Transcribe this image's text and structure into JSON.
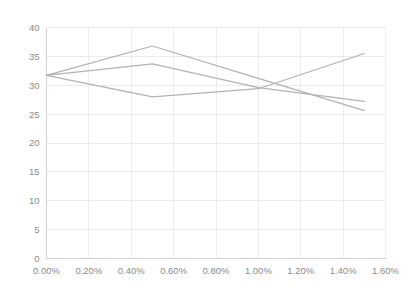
{
  "chart_data": {
    "type": "line",
    "title": "",
    "subtitle": "",
    "xlabel": "",
    "ylabel": "",
    "x": [
      0.0,
      0.5,
      1.0,
      1.5
    ],
    "x_tick_labels": [
      "0.00%",
      "0.20%",
      "0.40%",
      "0.60%",
      "0.80%",
      "1.00%",
      "1.20%",
      "1.40%",
      "1.60%"
    ],
    "x_tick_values": [
      0.0,
      0.2,
      0.4,
      0.6,
      0.8,
      1.0,
      1.2,
      1.4,
      1.6
    ],
    "y_tick_labels": [
      "0",
      "5",
      "10",
      "15",
      "20",
      "25",
      "30",
      "35",
      "40"
    ],
    "y_tick_values": [
      0,
      5,
      10,
      15,
      20,
      25,
      30,
      35,
      40
    ],
    "xlim": [
      0.0,
      1.6
    ],
    "ylim": [
      0,
      40
    ],
    "grid": true,
    "legend": "none",
    "series": [
      {
        "name": "Series 1",
        "color": "#b2b2b2",
        "values": [
          31.7,
          36.8,
          31.2,
          25.6
        ]
      },
      {
        "name": "Series 2",
        "color": "#b2b2b2",
        "values": [
          31.7,
          33.7,
          29.6,
          27.2
        ]
      },
      {
        "name": "Series 3",
        "color": "#b2b2b2",
        "values": [
          31.7,
          28.0,
          29.4,
          35.5
        ]
      }
    ]
  },
  "colors": {
    "background": "#ffffff",
    "grid": "#e2e2e2",
    "axis": "#cfcfcf",
    "tick_text": "#8a8a8a",
    "line": "#b2b2b2"
  }
}
